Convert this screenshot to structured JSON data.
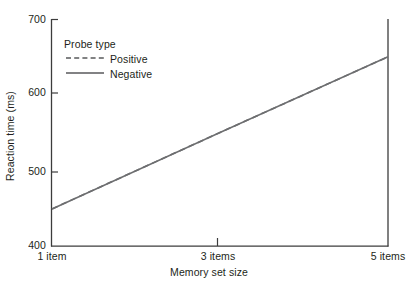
{
  "chart_data": {
    "type": "line",
    "title": "",
    "subtitle": "",
    "xlabel": "Memory set size",
    "ylabel": "Reaction time (ms)",
    "x": [
      1,
      3,
      5
    ],
    "xtick_labels": [
      "1 item",
      "3 items",
      "5 items"
    ],
    "ytick_labels": [
      "400",
      "500",
      "600",
      "700"
    ],
    "yticks": [
      400,
      500,
      600,
      700
    ],
    "ylim": [
      400,
      700
    ],
    "xlim": [
      1,
      5
    ],
    "grid": false,
    "legend_title": "Probe type",
    "legend_position": "upper-left-inside",
    "series": [
      {
        "name": "Positive",
        "style": "dashed",
        "color": "#6d6e70",
        "values": [
          449,
          550,
          650
        ]
      },
      {
        "name": "Negative",
        "style": "solid",
        "color": "#6d6e70",
        "values": [
          449,
          550,
          650
        ]
      }
    ],
    "annotations": []
  },
  "axes": {
    "y_label": "Reaction time (ms)",
    "x_label": "Memory set size",
    "y_ticks": [
      {
        "label": "700",
        "value": 700
      },
      {
        "label": "600",
        "value": 600
      },
      {
        "label": "500",
        "value": 500
      },
      {
        "label": "400",
        "value": 400
      }
    ],
    "x_ticks": [
      {
        "label": "1 item",
        "value": 1
      },
      {
        "label": "3 items",
        "value": 3
      },
      {
        "label": "5 items",
        "value": 5
      }
    ]
  },
  "legend": {
    "title": "Probe type",
    "entries": [
      {
        "label": "Positive",
        "swatch": "dashed-line-swatch"
      },
      {
        "label": "Negative",
        "swatch": "solid-line-swatch"
      }
    ]
  },
  "colors": {
    "axis": "#3c3c3c",
    "line": "#6d6e70",
    "text": "#231f20",
    "background": "#ffffff"
  }
}
